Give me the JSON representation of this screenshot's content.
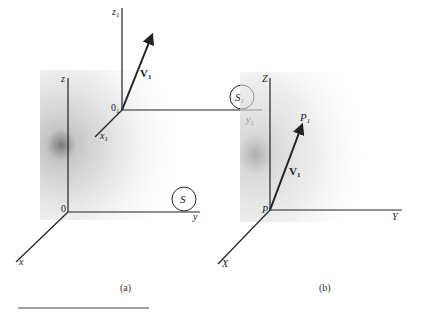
{
  "figure": {
    "panel_a": {
      "caption": "(a)",
      "frame_S": {
        "label": "S",
        "origin": "0",
        "axes": {
          "x": "x",
          "y": "y",
          "z": "z"
        }
      },
      "frame_S1": {
        "label": "S",
        "label_sub": "1",
        "origin": "0",
        "origin_sub": "1",
        "axes": {
          "x": "x",
          "x_sub": "1",
          "y": "y",
          "y_sub": "1",
          "z": "z",
          "z_sub": "1"
        }
      },
      "vector": {
        "label": "V",
        "label_sub": "1"
      }
    },
    "panel_b": {
      "caption": "(b)",
      "origin": "P",
      "axes": {
        "x": "X",
        "y": "Y",
        "z": "Z"
      },
      "point": {
        "label": "P",
        "label_sub": "1"
      },
      "vector": {
        "label": "V",
        "label_sub": "1"
      }
    }
  },
  "colors": {
    "ink": "#222222",
    "shade": "#9a9a9a"
  }
}
